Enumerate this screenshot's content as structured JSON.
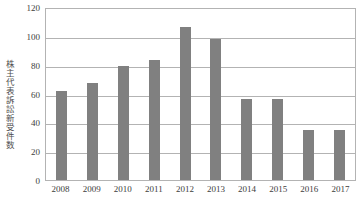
{
  "chart_data": {
    "type": "bar",
    "title": "",
    "xlabel": "",
    "ylabel": "株主代表訴訟新受件数",
    "categories": [
      "2008",
      "2009",
      "2010",
      "2011",
      "2012",
      "2013",
      "2014",
      "2015",
      "2016",
      "2017"
    ],
    "values": [
      62,
      67,
      79,
      83,
      106,
      98,
      56,
      56,
      35,
      35
    ],
    "ylim": [
      0,
      120
    ],
    "yticks": [
      0,
      20,
      40,
      60,
      80,
      100,
      120
    ],
    "ytick_labels": [
      "0",
      "20",
      "40",
      "60",
      "80",
      "100",
      "120"
    ],
    "grid": true,
    "legend": false,
    "series": [
      {
        "name": "株主代表訴訟新受件数",
        "values": [
          62,
          67,
          79,
          83,
          106,
          98,
          56,
          56,
          35,
          35
        ]
      }
    ],
    "colors": {
      "bar": "#808080",
      "gridline": "#b3b3b3",
      "frame": "#b3b3b3",
      "text": "#3d3d3d",
      "background": "#ffffff"
    }
  }
}
